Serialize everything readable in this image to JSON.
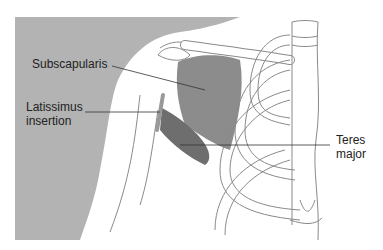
{
  "figure": {
    "type": "anatomical-diagram",
    "colors": {
      "background": "#ffffff",
      "body_silhouette": "#b3b3b3",
      "subscapularis": "#8c8c8c",
      "teres_major": "#6e6e6e",
      "bone_outline": "#8a8a8a",
      "leader_line": "#333333",
      "label_text": "#222222"
    },
    "labels": {
      "subscapularis": "Subscapularis",
      "latissimus_line1": "Latissimus",
      "latissimus_line2": "insertion",
      "teres_line1": "Teres",
      "teres_line2": "major"
    }
  }
}
